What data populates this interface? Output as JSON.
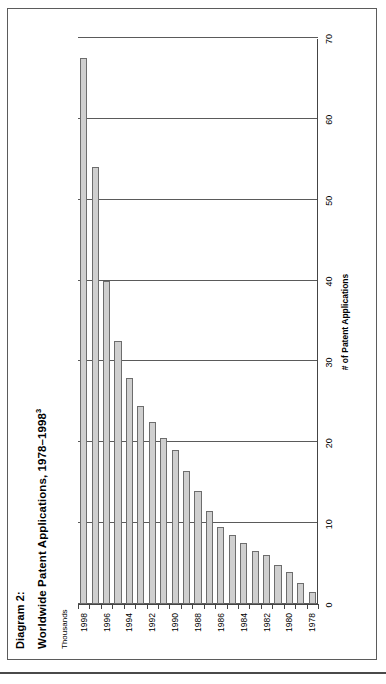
{
  "figure": {
    "label": "Diagram 2:",
    "title": "Worldwide Patent Applications, 1978–1998",
    "title_superscript": "3",
    "units_label": "Thousands"
  },
  "colors": {
    "bar_fill": "#cfcfcf",
    "bar_stroke": "#6d6d6d",
    "grid": "#5a5a5a",
    "axis": "#444444",
    "frame": "#5b5b5b",
    "background": "#ffffff"
  },
  "chart_data": {
    "type": "bar",
    "orientation": "horizontal",
    "title": "Worldwide Patent Applications, 1978–1998",
    "subtitle": "Thousands",
    "xlabel": "# of Patent Applications",
    "ylabel": "",
    "categories": [
      "1978",
      "1979",
      "1980",
      "1981",
      "1982",
      "1983",
      "1984",
      "1985",
      "1986",
      "1987",
      "1988",
      "1989",
      "1990",
      "1991",
      "1992",
      "1993",
      "1994",
      "1995",
      "1996",
      "1997",
      "1998"
    ],
    "values": [
      1.5,
      2.6,
      4.0,
      4.8,
      6.0,
      6.6,
      7.5,
      8.5,
      9.5,
      11.5,
      14.0,
      16.5,
      19.0,
      20.5,
      22.5,
      24.5,
      28.0,
      32.5,
      40.0,
      54.0,
      67.5
    ],
    "xlim": [
      0,
      70
    ],
    "xticks": [
      0,
      10,
      20,
      30,
      40,
      50,
      60,
      70
    ],
    "xtick_labels": [
      "0",
      "10",
      "20",
      "30",
      "40",
      "50",
      "60",
      "70"
    ],
    "ytick_labels": [
      "1978",
      "1980",
      "1982",
      "1984",
      "1986",
      "1988",
      "1990",
      "1992",
      "1994",
      "1996",
      "1998"
    ],
    "grid": true,
    "legend": "none"
  }
}
